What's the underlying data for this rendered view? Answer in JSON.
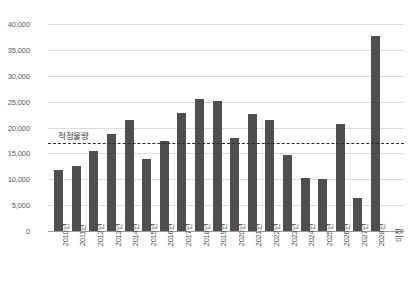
{
  "chart_data": {
    "type": "bar",
    "title": "",
    "subtitle": "",
    "xlabel": "",
    "ylabel": "",
    "ylim": [
      0,
      40000
    ],
    "ytick_step": 5000,
    "grid": true,
    "legend": "none",
    "bar_color": "#4f4f4f",
    "categories": [
      "2010년",
      "2011년",
      "2012년",
      "2013년",
      "2014년",
      "2015년",
      "2016년",
      "2017년",
      "2018년",
      "2019년",
      "2020년",
      "2021년",
      "2022년",
      "2023년",
      "2024년",
      "2025년",
      "2026년",
      "2027년",
      "2028년",
      "미정"
    ],
    "values": [
      11800,
      12600,
      15400,
      18800,
      21400,
      13900,
      17400,
      22900,
      25500,
      25200,
      18000,
      22600,
      21400,
      14700,
      10300,
      10100,
      20700,
      6300,
      37600,
      0
    ],
    "ytick_labels": [
      "40,000",
      "35,000",
      "30,000",
      "25,000",
      "20,000",
      "15,000",
      "10,000",
      "5,000",
      "0"
    ],
    "ytick_values": [
      40000,
      35000,
      30000,
      25000,
      20000,
      15000,
      10000,
      5000,
      0
    ],
    "annotations": [
      {
        "name": "threshold",
        "label": "적정물량",
        "value": 17000,
        "style": "dashed-horizontal-line",
        "color": "#2b2b2b"
      }
    ]
  }
}
